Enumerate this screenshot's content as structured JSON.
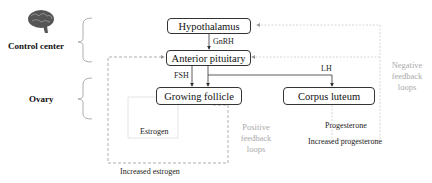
{
  "sections": {
    "control_center": "Control center",
    "ovary": "Ovary"
  },
  "nodes": {
    "hypothalamus": "Hypothalamus",
    "anterior_pituitary": "Anterior pituitary",
    "growing_follicle": "Growing follicle",
    "corpus_luteum": "Corpus luteum"
  },
  "edges": {
    "gnrh": "GnRH",
    "fsh": "FSH",
    "lh": "LH",
    "estrogen": "Estrogen",
    "progesterone": "Progesterone"
  },
  "annotations": {
    "increased_estrogen": "Increased estrogen",
    "increased_progesterone": "Increased progesterone",
    "positive_feedback": [
      "Positive",
      "feedback",
      "loops"
    ],
    "negative_feedback": [
      "Negative",
      "feedback",
      "loops"
    ]
  },
  "icons": {
    "brain": "brain-icon"
  }
}
